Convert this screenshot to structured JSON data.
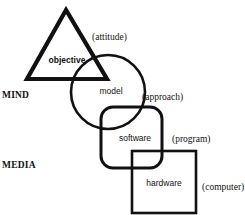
{
  "diagram": {
    "side_labels": {
      "mind": "MIND",
      "media": "MEDIA"
    },
    "nodes": [
      {
        "id": "objective",
        "shape": "triangle",
        "label": "objective",
        "annotation": "(attitude)"
      },
      {
        "id": "model",
        "shape": "circle",
        "label": "model",
        "annotation": "(approach)"
      },
      {
        "id": "software",
        "shape": "rounded-square",
        "label": "software",
        "annotation": "(program)"
      },
      {
        "id": "hardware",
        "shape": "square",
        "label": "hardware",
        "annotation": "(computer)"
      }
    ],
    "colors": {
      "stroke": "#111111",
      "background": "#ffffff"
    }
  }
}
